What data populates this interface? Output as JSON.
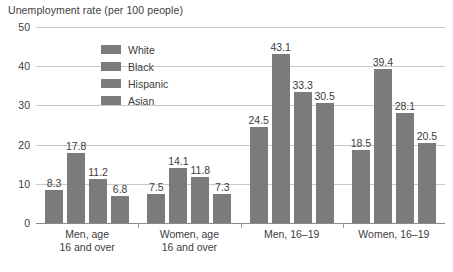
{
  "chart_data": {
    "type": "bar",
    "title": "Unemployment rate (per 100 people)",
    "xlabel": "",
    "ylabel": "",
    "ylim": [
      0,
      50
    ],
    "yticks": [
      0,
      10,
      20,
      30,
      40,
      50
    ],
    "grid": true,
    "legend_position": "inside-top-left",
    "categories": [
      "Men, age\n16 and over",
      "Women, age\n16 and over",
      "Men, 16–19",
      "Women, 16–19"
    ],
    "category_lines": [
      [
        "Men, age",
        "16 and over"
      ],
      [
        "Women, age",
        "16 and over"
      ],
      [
        "Men, 16–19"
      ],
      [
        "Women, 16–19"
      ]
    ],
    "series": [
      {
        "name": "White",
        "values": [
          8.3,
          7.5,
          24.5,
          18.5
        ]
      },
      {
        "name": "Black",
        "values": [
          17.8,
          14.1,
          43.1,
          39.4
        ]
      },
      {
        "name": "Hispanic",
        "values": [
          11.2,
          11.8,
          33.3,
          28.1
        ]
      },
      {
        "name": "Asian",
        "values": [
          6.8,
          7.3,
          30.5,
          20.5
        ]
      }
    ],
    "bar_color": "#7b7b7b",
    "gridline_color": "#c8c8c8",
    "axis_color": "#8a8a8a",
    "text_color": "#3d3d3d"
  }
}
